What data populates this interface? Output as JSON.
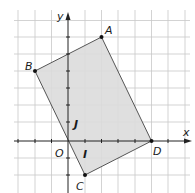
{
  "diagram": {
    "type": "coordinate-geometry",
    "axes": {
      "x_label": "x",
      "y_label": "y",
      "origin_label": "O"
    },
    "unit_labels": {
      "x_unit": "I",
      "y_unit": "J"
    },
    "grid": {
      "unit_px": 16.7,
      "origin_px": [
        68,
        141
      ],
      "x_range": [
        -3,
        7
      ],
      "y_range": [
        -3,
        7
      ]
    },
    "points": [
      {
        "name": "A",
        "x": 2,
        "y": 6
      },
      {
        "name": "B",
        "x": -2,
        "y": 4
      },
      {
        "name": "C",
        "x": 1,
        "y": -2
      },
      {
        "name": "D",
        "x": 5,
        "y": 0
      }
    ],
    "polygon": {
      "vertices": [
        "A",
        "B",
        "C",
        "D"
      ],
      "fill": "#dcdcdc",
      "stroke": "#555555"
    },
    "colors": {
      "grid": "#c8c8c8",
      "axis": "#222222"
    }
  }
}
